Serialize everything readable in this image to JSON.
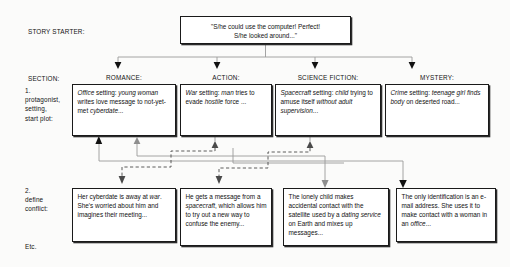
{
  "diagram": {
    "title_label": "STORY STARTER:",
    "starter": {
      "line1": "\"S/he could use the computer! Perfect!",
      "line2": "S/he looked around...\""
    },
    "left_labels": {
      "section": "SECTION:",
      "row1": "1.\nprotagonist,\nsetting,\nstart plot:",
      "row2": "2.\ndefine\nconflict:",
      "etc": "Etc."
    },
    "columns": [
      {
        "heading": "ROMANCE:"
      },
      {
        "heading": "ACTION:"
      },
      {
        "heading": "SCIENCE FICTION:"
      },
      {
        "heading": "MYSTERY:"
      }
    ],
    "row1_boxes": [
      {
        "name": "romance-row1",
        "segments": [
          {
            "text": "Office",
            "italic": true
          },
          {
            "text": " setting:  ",
            "italic": false
          },
          {
            "text": "young woman",
            "italic": true
          },
          {
            "text": " writes love message to  not-yet-met ",
            "italic": false
          },
          {
            "text": "cyberdate",
            "italic": true
          },
          {
            "text": "...",
            "italic": false
          }
        ]
      },
      {
        "name": "action-row1",
        "segments": [
          {
            "text": "War",
            "italic": true
          },
          {
            "text": " setting: ",
            "italic": false
          },
          {
            "text": "man",
            "italic": true
          },
          {
            "text": " tries to evade ",
            "italic": false
          },
          {
            "text": "hostile",
            "italic": true
          },
          {
            "text": " force ...",
            "italic": false
          }
        ]
      },
      {
        "name": "science-fiction-row1",
        "segments": [
          {
            "text": "Spacecraft",
            "italic": true
          },
          {
            "text": " setting: ",
            "italic": false
          },
          {
            "text": "child",
            "italic": true
          },
          {
            "text": " trying to amuse itself ",
            "italic": false
          },
          {
            "text": "without adult supervision",
            "italic": true
          },
          {
            "text": "...",
            "italic": false
          }
        ]
      },
      {
        "name": "mystery-row1",
        "segments": [
          {
            "text": "Crime",
            "italic": true
          },
          {
            "text": " setting:  ",
            "italic": false
          },
          {
            "text": "teenage girl finds body",
            "italic": true
          },
          {
            "text": " on deserted road...",
            "italic": false
          }
        ]
      }
    ],
    "row2_boxes": [
      {
        "name": "romance-row2",
        "segments": [
          {
            "text": "Her cyberdate is away at ",
            "italic": false
          },
          {
            "text": "war",
            "italic": true
          },
          {
            "text": ". She's worried about him and imagines their meeting...",
            "italic": false
          }
        ]
      },
      {
        "name": "action-row2",
        "segments": [
          {
            "text": "He gets a message from a ",
            "italic": false
          },
          {
            "text": "spacecraft",
            "italic": true
          },
          {
            "text": ", which allows him to try out a new way to confuse the enemy...",
            "italic": false
          }
        ]
      },
      {
        "name": "science-fiction-row2",
        "segments": [
          {
            "text": "The lonely child makes accidental contact with the satellite used by a ",
            "italic": false
          },
          {
            "text": "dating service",
            "italic": true
          },
          {
            "text": " on Earth and mixes up messages...",
            "italic": false
          }
        ]
      },
      {
        "name": "mystery-row2",
        "segments": [
          {
            "text": "The only identification is an e-mail address. She uses it to make contact with a woman in an ",
            "italic": false
          },
          {
            "text": "office",
            "italic": true
          },
          {
            "text": "...",
            "italic": false
          }
        ]
      }
    ],
    "colors": {
      "ink": "#1a1a1a",
      "connector_solid": "#8a8a8a",
      "connector_dashed": "#5c5c5c",
      "arrow_dark": "#111111",
      "background": "#fbfbfa"
    }
  }
}
